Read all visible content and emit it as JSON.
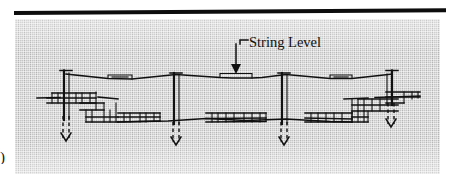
{
  "figure": {
    "kind": "technical-illustration",
    "annotation": {
      "label": "String Level",
      "leader": "elbow-line-with-down-arrow",
      "points_to": "line-level-on-string"
    },
    "panel": {
      "background_color": "#c6c6c6",
      "texture": "canvas-weave"
    },
    "ink_color": "#111111",
    "top_rule_color": "#0d0d0d",
    "edge_glyph": ")",
    "parts": [
      {
        "name": "string-line",
        "count": 1,
        "note": "taut line spanning all stakes, slight sag between stakes"
      },
      {
        "name": "line-level",
        "count": 2,
        "note": "small rectangular levels hung on the string"
      },
      {
        "name": "corner-stake",
        "count": 2,
        "note": "left and right stakes with T-cap and batter boards"
      },
      {
        "name": "intermediate-stake",
        "count": 2,
        "note": "tall center stakes driven through the ground line"
      },
      {
        "name": "batter-board",
        "count": 8,
        "note": "horizontal boards nailed across the stakes"
      },
      {
        "name": "ground-line",
        "count": 2,
        "note": "upper grade line and lower excavated grade line"
      },
      {
        "name": "driven-arrow",
        "count": 4,
        "note": "dashed arrows showing stakes driven into soil"
      }
    ]
  }
}
